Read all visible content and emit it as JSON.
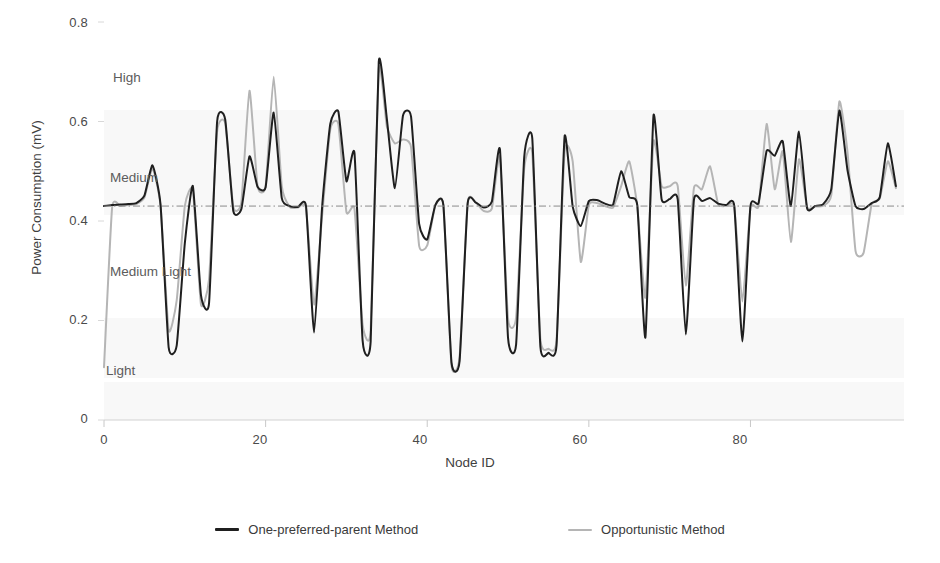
{
  "chart_data": {
    "type": "line",
    "title": "",
    "xlabel": "Node ID",
    "ylabel": "Power Consumption (mV)",
    "xlim": [
      0,
      99
    ],
    "ylim": [
      0,
      0.8
    ],
    "xticks": [
      "0",
      "20",
      "40",
      "60",
      "80"
    ],
    "xtick_values": [
      0,
      20,
      40,
      60,
      80
    ],
    "yticks": [
      "0",
      "0.2",
      "0.4",
      "0.6",
      "0.8"
    ],
    "ytick_values": [
      0,
      0.2,
      0.4,
      0.6,
      0.8
    ],
    "grid": false,
    "legend_position": "bottom",
    "reference_line": {
      "label": "average-threshold",
      "value": 0.43,
      "style": "dash-dot",
      "color": "#8a8a8a"
    },
    "annotations": [
      {
        "text": "High",
        "x": 5.5,
        "y": 0.685
      },
      {
        "text": "Medium",
        "x": 5.0,
        "y": 0.5
      },
      {
        "text": "Medium Light",
        "x": 5.0,
        "y": 0.285
      },
      {
        "text": "Light",
        "x": 4.5,
        "y": 0.105
      }
    ],
    "series": [
      {
        "name": "One-preferred-parent Method",
        "color": "#1f1f1f",
        "width": 2.0,
        "values": [
          0.43,
          0.432,
          0.433,
          0.434,
          0.436,
          0.451,
          0.512,
          0.432,
          0.146,
          0.15,
          0.355,
          0.47,
          0.251,
          0.235,
          0.6,
          0.604,
          0.42,
          0.424,
          0.53,
          0.469,
          0.468,
          0.618,
          0.446,
          0.43,
          0.428,
          0.43,
          0.176,
          0.43,
          0.595,
          0.62,
          0.48,
          0.536,
          0.16,
          0.158,
          0.72,
          0.606,
          0.466,
          0.612,
          0.61,
          0.394,
          0.363,
          0.432,
          0.432,
          0.116,
          0.118,
          0.435,
          0.437,
          0.427,
          0.439,
          0.544,
          0.165,
          0.152,
          0.528,
          0.566,
          0.148,
          0.135,
          0.15,
          0.57,
          0.429,
          0.39,
          0.44,
          0.442,
          0.435,
          0.433,
          0.5,
          0.448,
          0.431,
          0.166,
          0.612,
          0.444,
          0.444,
          0.443,
          0.172,
          0.442,
          0.44,
          0.446,
          0.435,
          0.432,
          0.43,
          0.158,
          0.43,
          0.436,
          0.541,
          0.531,
          0.56,
          0.43,
          0.58,
          0.426,
          0.43,
          0.434,
          0.464,
          0.622,
          0.503,
          0.43,
          0.424,
          0.436,
          0.448,
          0.556,
          0.47
        ]
      },
      {
        "name": "Opportunistic Method",
        "color": "#b5b5b5",
        "width": 2.0,
        "values": [
          0.106,
          0.426,
          0.43,
          0.432,
          0.434,
          0.447,
          0.506,
          0.43,
          0.18,
          0.241,
          0.43,
          0.462,
          0.232,
          0.283,
          0.58,
          0.597,
          0.428,
          0.438,
          0.662,
          0.47,
          0.47,
          0.69,
          0.47,
          0.428,
          0.427,
          0.426,
          0.232,
          0.412,
          0.584,
          0.595,
          0.418,
          0.424,
          0.192,
          0.18,
          0.706,
          0.59,
          0.556,
          0.564,
          0.548,
          0.35,
          0.351,
          0.431,
          0.431,
          0.11,
          0.126,
          0.437,
          0.437,
          0.42,
          0.425,
          0.528,
          0.203,
          0.206,
          0.505,
          0.536,
          0.163,
          0.143,
          0.16,
          0.54,
          0.52,
          0.318,
          0.432,
          0.436,
          0.43,
          0.427,
          0.47,
          0.52,
          0.429,
          0.246,
          0.56,
          0.47,
          0.47,
          0.47,
          0.27,
          0.466,
          0.464,
          0.51,
          0.434,
          0.43,
          0.428,
          0.238,
          0.428,
          0.43,
          0.595,
          0.464,
          0.54,
          0.358,
          0.524,
          0.428,
          0.429,
          0.431,
          0.452,
          0.64,
          0.54,
          0.34,
          0.336,
          0.434,
          0.445,
          0.52,
          0.466
        ]
      }
    ]
  },
  "legend": {
    "items": [
      {
        "label": "One-preferred-parent Method",
        "color": "#1f1f1f"
      },
      {
        "label": "Opportunistic Method",
        "color": "#b5b5b5"
      }
    ]
  },
  "background_bleed": [
    {
      "text": "",
      "x": 0,
      "y": 0
    }
  ]
}
